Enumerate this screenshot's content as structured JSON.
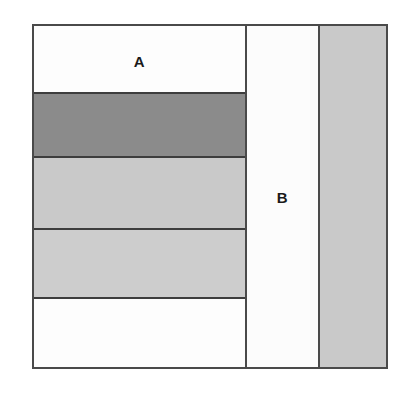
{
  "diagram": {
    "title": "",
    "background_color": "#ffffff",
    "frame": {
      "border_color": "#4a4a4a",
      "fill_color": "#fdfdfd"
    },
    "palette": {
      "white": "#fdfdfd",
      "light_gray": "#c9c9c9",
      "dark_gray": "#8b8b8b",
      "divider": "#3d3d3d",
      "label_text": "#1a1a1a"
    },
    "regions": [
      {
        "name": "region-a",
        "label": "A",
        "label_visible": true,
        "bands": [
          {
            "name": "band-a-1",
            "fill": "white",
            "color": "#fdfdfd"
          },
          {
            "name": "band-a-2",
            "fill": "dark_gray",
            "color": "#8b8b8b"
          },
          {
            "name": "band-a-3",
            "fill": "light_gray",
            "color": "#c9c9c9"
          },
          {
            "name": "band-a-4",
            "fill": "light_gray",
            "color": "#cdcdcd"
          },
          {
            "name": "band-a-5",
            "fill": "white",
            "color": "#fdfdfd"
          }
        ]
      },
      {
        "name": "region-b",
        "label": "B",
        "label_visible": true,
        "fill": "white",
        "color": "#fcfcfc"
      },
      {
        "name": "region-c",
        "label": "",
        "label_visible": false,
        "fill": "light_gray",
        "color": "#c9c9c9"
      }
    ]
  }
}
